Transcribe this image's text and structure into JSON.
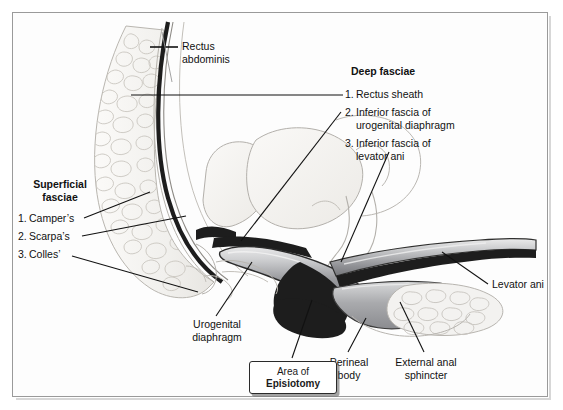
{
  "figure": {
    "title_hidden": "",
    "labels": {
      "rectus_abdominis": "Rectus\nabdominis",
      "rectus_abdominis_l1": "Rectus",
      "rectus_abdominis_l2": "abdominis",
      "levator_ani": "Levator ani",
      "urogenital_diaphragm_l1": "Urogenital",
      "urogenital_diaphragm_l2": "diaphragm",
      "perineal_body_l1": "Perineal",
      "perineal_body_l2": "body",
      "external_anal_sphincter_l1": "External anal",
      "external_anal_sphincter_l2": "sphincter"
    },
    "superficial_fasciae": {
      "heading_l1": "Superficial",
      "heading_l2": "fasciae",
      "items": [
        {
          "num": "1.",
          "label": "Camper’s"
        },
        {
          "num": "2.",
          "label": "Scarpa’s"
        },
        {
          "num": "3.",
          "label": "Colles’"
        }
      ]
    },
    "deep_fasciae": {
      "heading": "Deep fasciae",
      "items": [
        {
          "num": "1.",
          "label": "Rectus sheath",
          "line2": ""
        },
        {
          "num": "2.",
          "label": "Inferior fascia of",
          "line2": "urogenital diaphragm"
        },
        {
          "num": "3.",
          "label": "Inferior fascia of",
          "line2": "levator ani"
        }
      ]
    },
    "callout_box": {
      "line1": "Area of",
      "line2": "Episiotomy"
    },
    "colors": {
      "frame_border": "#9a9a9a",
      "leader_line": "#111111",
      "fat_tissue": "#f0efec",
      "fat_outline": "#b9b6b0",
      "dark_fascia": "#1d1d1d",
      "muscle_light": "#d8d8d8",
      "muscle_mid": "#8f9093",
      "muscle_dark": "#6b6c70",
      "organ_fill": "#f4f3f1",
      "organ_outline": "#b3b0ab",
      "text": "#111111"
    }
  }
}
